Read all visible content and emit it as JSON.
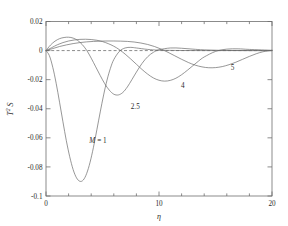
{
  "chart_data": {
    "type": "line",
    "title": "",
    "subtitle": "",
    "xlabel": "η",
    "ylabel": "T² S",
    "xlim": [
      0,
      20
    ],
    "ylim": [
      -0.1,
      0.02
    ],
    "xticks": [
      0,
      10,
      20
    ],
    "xticklabels": [
      "0",
      "10",
      "20"
    ],
    "xminorticks": [
      2,
      4,
      6,
      8,
      12,
      14,
      16,
      18
    ],
    "yticks": [
      0.02,
      0,
      -0.02,
      -0.04,
      -0.06,
      -0.08,
      -0.1
    ],
    "yticklabels": [
      "0.02",
      "0",
      "-0.02",
      "-0.04",
      "-0.06",
      "-0.08",
      "-0.1"
    ],
    "grid": false,
    "legend_position": "inline-annotations",
    "reference_lines": [
      {
        "name": "zero-line",
        "orientation": "horizontal",
        "y": 0,
        "style": "dashed",
        "x_from": 0,
        "x_to": 20
      }
    ],
    "annotations": [
      {
        "text": "M = 1",
        "x": 4.6,
        "y": -0.0635,
        "series": "M = 1"
      },
      {
        "text": "2.5",
        "x": 7.9,
        "y": -0.0405,
        "series": "M = 2.5"
      },
      {
        "text": "4",
        "x": 12.1,
        "y": -0.0258,
        "series": "M = 4"
      },
      {
        "text": "5",
        "x": 16.5,
        "y": -0.0132,
        "series": "M = 5"
      }
    ],
    "series": [
      {
        "name": "M = 1",
        "label": "M = 1",
        "color": "#6a6a6a",
        "x": [
          0,
          0.3,
          0.6,
          0.9,
          1.2,
          1.5,
          1.8,
          2.1,
          2.4,
          2.7,
          3.0,
          3.3,
          3.6,
          3.9,
          4.2,
          4.5,
          4.8,
          5.1,
          5.4,
          5.7,
          6.0,
          6.5,
          7.0,
          7.5,
          8.0,
          9.0,
          10.0,
          12.0,
          14.0,
          16.0,
          18.0,
          20.0
        ],
        "y": [
          0,
          -0.0035,
          -0.0115,
          -0.0225,
          -0.0355,
          -0.049,
          -0.062,
          -0.073,
          -0.0818,
          -0.0875,
          -0.0899,
          -0.089,
          -0.0845,
          -0.0768,
          -0.0665,
          -0.0545,
          -0.0422,
          -0.0305,
          -0.0203,
          -0.0122,
          -0.0062,
          -0.0005,
          0.0018,
          0.0022,
          0.0018,
          0.0008,
          0.0003,
          5e-05,
          0,
          0,
          0,
          0
        ]
      },
      {
        "name": "M = 2.5",
        "label": "2.5",
        "color": "#6a6a6a",
        "x": [
          0,
          0.4,
          0.8,
          1.2,
          1.6,
          2.0,
          2.4,
          2.8,
          3.2,
          3.6,
          4.0,
          4.4,
          4.8,
          5.2,
          5.6,
          6.0,
          6.4,
          6.8,
          7.2,
          7.6,
          8.0,
          8.5,
          9.0,
          9.5,
          10.0,
          11.0,
          12.0,
          13.0,
          14.0,
          16.0,
          18.0,
          20.0
        ],
        "y": [
          0,
          0.0038,
          0.0065,
          0.0082,
          0.009,
          0.0092,
          0.0086,
          0.007,
          0.0042,
          0.0002,
          -0.0052,
          -0.0112,
          -0.0172,
          -0.0228,
          -0.0272,
          -0.03,
          -0.0305,
          -0.0288,
          -0.025,
          -0.02,
          -0.0148,
          -0.0088,
          -0.0042,
          -0.0012,
          0.0005,
          0.0018,
          0.0016,
          0.001,
          0.0005,
          0.0001,
          0,
          0
        ]
      },
      {
        "name": "M = 4",
        "label": "4",
        "color": "#6a6a6a",
        "x": [
          0,
          0.5,
          1.0,
          1.5,
          2.0,
          2.5,
          3.0,
          3.5,
          4.0,
          4.5,
          5.0,
          5.5,
          6.0,
          6.5,
          7.0,
          7.5,
          8.0,
          8.5,
          9.0,
          9.5,
          10.0,
          10.5,
          11.0,
          11.5,
          12.0,
          12.5,
          13.0,
          13.5,
          14.0,
          15.0,
          16.0,
          17.0,
          18.0,
          20.0
        ],
        "y": [
          0,
          0.002,
          0.004,
          0.0055,
          0.0066,
          0.0073,
          0.0077,
          0.0078,
          0.0076,
          0.0071,
          0.0062,
          0.0048,
          0.003,
          0.0006,
          -0.0024,
          -0.0058,
          -0.0094,
          -0.013,
          -0.0162,
          -0.0188,
          -0.0204,
          -0.021,
          -0.0205,
          -0.019,
          -0.0166,
          -0.0136,
          -0.0104,
          -0.0072,
          -0.0044,
          -0.0006,
          0.001,
          0.0012,
          0.0008,
          0.0002
        ]
      },
      {
        "name": "M = 5",
        "label": "5",
        "color": "#6a6a6a",
        "x": [
          0,
          0.6,
          1.2,
          1.8,
          2.4,
          3.0,
          3.6,
          4.2,
          4.8,
          5.4,
          6.0,
          6.6,
          7.2,
          7.8,
          8.4,
          9.0,
          9.6,
          10.2,
          10.8,
          11.4,
          12.0,
          12.6,
          13.2,
          13.8,
          14.4,
          15.0,
          15.6,
          16.2,
          16.8,
          17.4,
          18.0,
          18.6,
          19.2,
          20.0
        ],
        "y": [
          0,
          0.0014,
          0.0028,
          0.0039,
          0.0048,
          0.0055,
          0.006,
          0.0063,
          0.0065,
          0.0066,
          0.0066,
          0.0065,
          0.0063,
          0.0059,
          0.0052,
          0.0042,
          0.0028,
          0.001,
          -0.0012,
          -0.0036,
          -0.006,
          -0.0082,
          -0.01,
          -0.0112,
          -0.0118,
          -0.0117,
          -0.011,
          -0.0097,
          -0.008,
          -0.006,
          -0.004,
          -0.0022,
          -0.0008,
          0.0002
        ]
      }
    ]
  },
  "axes": {
    "x_title": "η",
    "y_title_main": "T",
    "y_title_exp": "2",
    "y_title_tail": " S"
  }
}
